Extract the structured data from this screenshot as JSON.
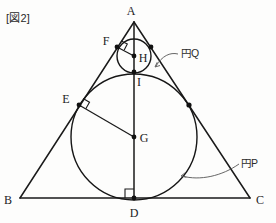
{
  "figure": {
    "caption": "[図2]",
    "width": 276,
    "height": 223,
    "ink_color": "#1a1a1a",
    "leader_color": "#555555"
  },
  "labels": {
    "A": "A",
    "B": "B",
    "C": "C",
    "D": "D",
    "E": "E",
    "F": "F",
    "G": "G",
    "H": "H",
    "I": "I",
    "circle_p": "円P",
    "circle_q": "円Q"
  },
  "points": {
    "A": {
      "x": 134,
      "y": 22,
      "label": "A",
      "label_x": 131,
      "label_y": 15
    },
    "B": {
      "x": 20,
      "y": 198,
      "label": "B",
      "label_x": 8,
      "label_y": 204
    },
    "C": {
      "x": 250,
      "y": 198,
      "label": "C",
      "label_x": 256,
      "label_y": 204
    },
    "D": {
      "x": 134,
      "y": 198,
      "label": "D",
      "label_x": 130,
      "label_y": 216
    },
    "E": {
      "x": 79,
      "y": 105,
      "label": "E",
      "label_x": 66,
      "label_y": 102
    },
    "F": {
      "x": 117,
      "y": 47,
      "label": "F",
      "label_x": 106,
      "label_y": 46
    },
    "G": {
      "x": 134,
      "y": 137,
      "label": "G",
      "label_x": 141,
      "label_y": 142
    },
    "H": {
      "x": 134,
      "y": 56,
      "label": "H",
      "label_x": 139,
      "label_y": 62
    },
    "I": {
      "x": 134,
      "y": 72,
      "label": "I",
      "label_x": 138,
      "label_y": 85
    }
  },
  "circles": {
    "P": {
      "cx": 134,
      "cy": 137,
      "r": 63,
      "name": "円P"
    },
    "Q": {
      "cx": 134,
      "cy": 56,
      "r": 17,
      "name": "円Q"
    }
  },
  "tangency_dots": [
    {
      "x": 79,
      "y": 105,
      "on": "P-AB"
    },
    {
      "x": 189,
      "y": 105,
      "on": "P-AC"
    },
    {
      "x": 134,
      "y": 198,
      "on": "P-BC"
    },
    {
      "x": 134,
      "y": 72,
      "on": "P-Q"
    },
    {
      "x": 117,
      "y": 47,
      "on": "Q-AB"
    },
    {
      "x": 151,
      "y": 47,
      "on": "Q-AC"
    },
    {
      "x": 134,
      "y": 137,
      "on": "center-G"
    },
    {
      "x": 134,
      "y": 56,
      "on": "center-H"
    }
  ],
  "annotations": [
    {
      "id": "circle-q-callout",
      "text": "円Q",
      "text_x": 182,
      "text_y": 57,
      "arrow_tip_x": 155,
      "arrow_tip_y": 67
    },
    {
      "id": "circle-p-callout",
      "text": "円P",
      "text_x": 242,
      "text_y": 167,
      "arrow_tip_x": 181,
      "arrow_tip_y": 176
    }
  ],
  "right_angle_markers": [
    {
      "id": "right-angle-at-e",
      "x": 79,
      "y": 105
    },
    {
      "id": "right-angle-at-f",
      "x": 117,
      "y": 47
    },
    {
      "id": "right-angle-at-d",
      "x": 134,
      "y": 198
    }
  ],
  "segments": [
    {
      "id": "side-ab",
      "from": "A",
      "to": "B"
    },
    {
      "id": "side-ac",
      "from": "A",
      "to": "C"
    },
    {
      "id": "side-bc",
      "from": "B",
      "to": "C"
    },
    {
      "id": "axis-ad",
      "from": "A",
      "to": "D"
    },
    {
      "id": "radius-ge",
      "from": "G",
      "to": "E"
    },
    {
      "id": "radius-hf",
      "from": "H",
      "to": "F"
    }
  ]
}
